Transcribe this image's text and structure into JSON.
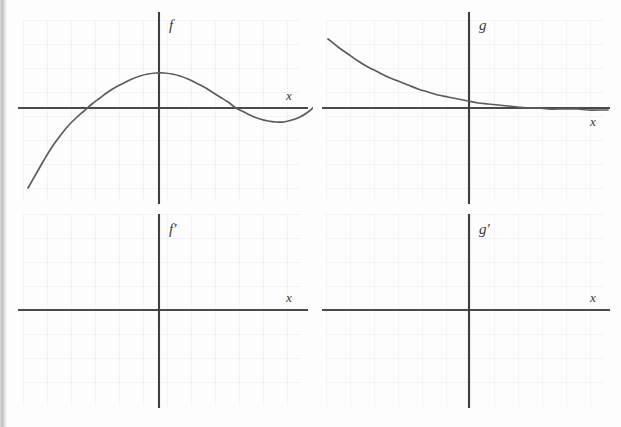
{
  "figure": {
    "panel_count": 4,
    "background_color": "#fdfdfd",
    "axis_color": "#444444",
    "grid_color": "#e7e7ee",
    "curve_color": "#585858"
  },
  "cut_header": {
    "text": "· ·   · ·                         ·   · ·     ·           ·   ·"
  },
  "panels": [
    {
      "id": "f",
      "function_label": "f",
      "x_axis_label": "x",
      "has_curve": true,
      "curve_type": "cubic",
      "description": "Cubic curve rising from lower left, crossing the x-axis, reaching a local maximum, decreasing through a local minimum below the axis, then rising steeply at the right.",
      "origin": {
        "x": 159,
        "y": 108
      },
      "grid_spacing": 24,
      "curve_points": [
        [
          20,
          180
        ],
        [
          28,
          166
        ],
        [
          36,
          152
        ],
        [
          44,
          139
        ],
        [
          52,
          128
        ],
        [
          60,
          118
        ],
        [
          68,
          110
        ],
        [
          76,
          103
        ],
        [
          84,
          96
        ],
        [
          92,
          90
        ],
        [
          100,
          84
        ],
        [
          108,
          79
        ],
        [
          116,
          75
        ],
        [
          124,
          71
        ],
        [
          132,
          68
        ],
        [
          140,
          66
        ],
        [
          148,
          65
        ],
        [
          156,
          65
        ],
        [
          164,
          66
        ],
        [
          172,
          68
        ],
        [
          180,
          71
        ],
        [
          188,
          75
        ],
        [
          196,
          79
        ],
        [
          204,
          84
        ],
        [
          212,
          89
        ],
        [
          220,
          94
        ],
        [
          228,
          100
        ],
        [
          236,
          104
        ],
        [
          244,
          108
        ],
        [
          252,
          111
        ],
        [
          260,
          113
        ],
        [
          268,
          114
        ],
        [
          276,
          114
        ],
        [
          284,
          112
        ],
        [
          292,
          109
        ],
        [
          300,
          104
        ],
        [
          308,
          97
        ],
        [
          316,
          88
        ],
        [
          324,
          77
        ],
        [
          332,
          64
        ],
        [
          340,
          50
        ],
        [
          348,
          36
        ]
      ],
      "x_intercepts_px": [
        53,
        265,
        287
      ],
      "local_max_px": {
        "x": 153,
        "y": 65
      },
      "local_min_px": {
        "x": 274,
        "y": 114
      }
    },
    {
      "id": "g",
      "function_label": "g",
      "x_axis_label": "x",
      "has_curve": true,
      "curve_type": "exponential-decay",
      "description": "Decreasing exponential curve starting high on the left, falling steeply then flattening out as it approaches the x-axis asymptotically on the right.",
      "origin": {
        "x": 159,
        "y": 108
      },
      "grid_spacing": 24,
      "curve_points": [
        [
          10,
          31
        ],
        [
          20,
          39
        ],
        [
          30,
          46
        ],
        [
          40,
          53
        ],
        [
          50,
          59
        ],
        [
          60,
          64
        ],
        [
          70,
          69
        ],
        [
          80,
          73
        ],
        [
          90,
          77
        ],
        [
          100,
          81
        ],
        [
          110,
          84
        ],
        [
          120,
          87
        ],
        [
          130,
          89
        ],
        [
          140,
          91
        ],
        [
          150,
          93
        ],
        [
          160,
          95
        ],
        [
          170,
          96
        ],
        [
          180,
          97
        ],
        [
          190,
          98
        ],
        [
          200,
          99
        ],
        [
          210,
          100
        ],
        [
          220,
          100
        ],
        [
          230,
          101
        ],
        [
          240,
          101
        ],
        [
          250,
          101
        ],
        [
          260,
          101
        ],
        [
          270,
          102
        ],
        [
          280,
          102
        ],
        [
          290,
          102
        ]
      ]
    },
    {
      "id": "f-prime",
      "function_label": "f′",
      "x_axis_label": "x",
      "has_curve": false,
      "description": "Empty coordinate grid provided for sketching the derivative of f.",
      "origin": {
        "x": 159,
        "y": 108
      },
      "grid_spacing": 24
    },
    {
      "id": "g-prime",
      "function_label": "g′",
      "x_axis_label": "x",
      "has_curve": false,
      "description": "Empty coordinate grid provided for sketching the derivative of g.",
      "origin": {
        "x": 159,
        "y": 108
      },
      "grid_spacing": 24
    }
  ]
}
